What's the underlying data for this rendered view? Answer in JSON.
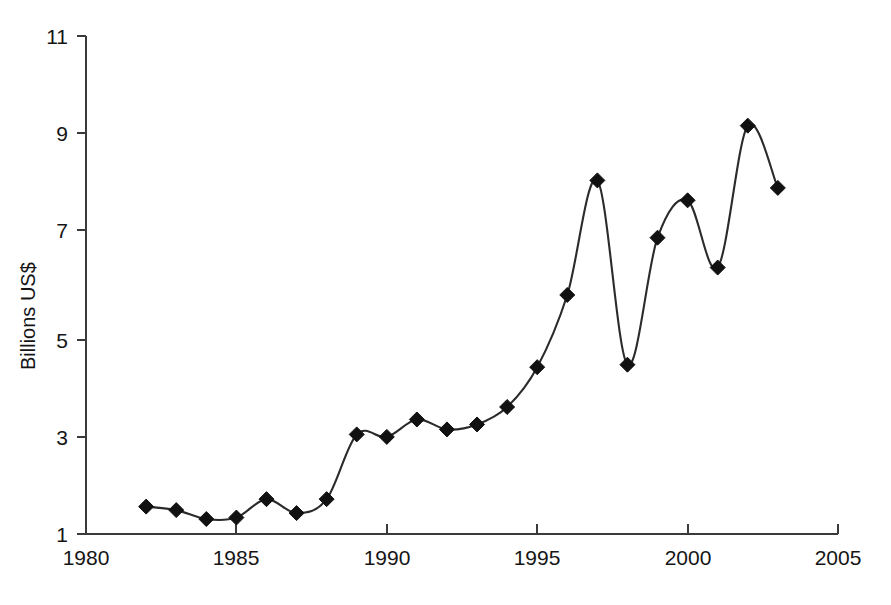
{
  "chart_data": {
    "type": "line",
    "title": "",
    "subtitle": "",
    "xlabel": "",
    "ylabel": "Billions US$",
    "xlim": [
      1980,
      2005
    ],
    "ylim": [
      1,
      11
    ],
    "xticks": [
      1980,
      1985,
      1990,
      1995,
      2000,
      2005
    ],
    "xtick_labels": [
      "1980",
      "1985",
      "1990",
      "1995",
      "2000",
      "2005"
    ],
    "yticks": [
      1,
      3,
      5,
      7,
      9,
      11
    ],
    "ytick_labels": [
      "1",
      "3",
      "5",
      "7",
      "9",
      "11"
    ],
    "grid": false,
    "legend": false,
    "legend_position": "none",
    "marker": "diamond",
    "line_style": "smooth",
    "series": [
      {
        "name": "Billions US$",
        "color": "#111111",
        "x": [
          1982,
          1983,
          1984,
          1985,
          1986,
          1987,
          1988,
          1989,
          1990,
          1991,
          1992,
          1993,
          1994,
          1995,
          1996,
          1997,
          1998,
          1999,
          2000,
          2001,
          2002,
          2003
        ],
        "values": [
          1.55,
          1.48,
          1.3,
          1.33,
          1.7,
          1.42,
          1.7,
          3.0,
          2.95,
          3.3,
          3.1,
          3.2,
          3.55,
          4.35,
          5.8,
          8.1,
          4.4,
          6.95,
          7.7,
          6.35,
          9.2,
          7.95
        ]
      }
    ]
  },
  "axes": {
    "y_axis_title": "Billions US$"
  }
}
